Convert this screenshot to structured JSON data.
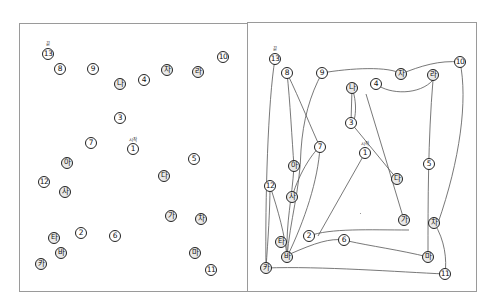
{
  "panels": {
    "left": {
      "title": "",
      "start_label": "시작",
      "end_label": "끝",
      "nodes": [
        {
          "label": "13",
          "x": 48,
          "y": 54
        },
        {
          "label": "8",
          "x": 60,
          "y": 69
        },
        {
          "label": "9",
          "x": 93,
          "y": 69
        },
        {
          "label": "나",
          "x": 120,
          "y": 84
        },
        {
          "label": "4",
          "x": 144,
          "y": 80
        },
        {
          "label": "자",
          "x": 167,
          "y": 70
        },
        {
          "label": "라",
          "x": 198,
          "y": 72
        },
        {
          "label": "10",
          "x": 223,
          "y": 57
        },
        {
          "label": "3",
          "x": 120,
          "y": 118
        },
        {
          "label": "7",
          "x": 91,
          "y": 143
        },
        {
          "label": "1",
          "x": 133,
          "y": 149
        },
        {
          "label": "아",
          "x": 67,
          "y": 163
        },
        {
          "label": "5",
          "x": 194,
          "y": 159
        },
        {
          "label": "다",
          "x": 164,
          "y": 176
        },
        {
          "label": "12",
          "x": 44,
          "y": 182
        },
        {
          "label": "사",
          "x": 65,
          "y": 192
        },
        {
          "label": "가",
          "x": 171,
          "y": 216
        },
        {
          "label": "차",
          "x": 201,
          "y": 219
        },
        {
          "label": "2",
          "x": 81,
          "y": 233
        },
        {
          "label": "6",
          "x": 115,
          "y": 236
        },
        {
          "label": "타",
          "x": 54,
          "y": 238
        },
        {
          "label": "바",
          "x": 61,
          "y": 253
        },
        {
          "label": "마",
          "x": 195,
          "y": 253
        },
        {
          "label": "카",
          "x": 41,
          "y": 264
        },
        {
          "label": "11",
          "x": 211,
          "y": 270
        }
      ]
    },
    "right": {
      "start_label": "시작",
      "end_label": "끝",
      "nodes": [
        {
          "label": "13",
          "x": 275,
          "y": 59
        },
        {
          "label": "8",
          "x": 287,
          "y": 73
        },
        {
          "label": "9",
          "x": 322,
          "y": 73
        },
        {
          "label": "나",
          "x": 352,
          "y": 88
        },
        {
          "label": "4",
          "x": 376,
          "y": 84
        },
        {
          "label": "자",
          "x": 401,
          "y": 74
        },
        {
          "label": "라",
          "x": 433,
          "y": 75
        },
        {
          "label": "10",
          "x": 460,
          "y": 62
        },
        {
          "label": "7",
          "x": 320,
          "y": 147
        },
        {
          "label": "3",
          "x": 351,
          "y": 123
        },
        {
          "label": "1",
          "x": 365,
          "y": 153
        },
        {
          "label": "아",
          "x": 294,
          "y": 166
        },
        {
          "label": "5",
          "x": 429,
          "y": 164
        },
        {
          "label": "다",
          "x": 397,
          "y": 179
        },
        {
          "label": "12",
          "x": 270,
          "y": 186
        },
        {
          "label": "사",
          "x": 292,
          "y": 197
        },
        {
          "label": "가",
          "x": 404,
          "y": 220
        },
        {
          "label": "차",
          "x": 434,
          "y": 223
        },
        {
          "label": "2",
          "x": 309,
          "y": 236
        },
        {
          "label": "6",
          "x": 344,
          "y": 240
        },
        {
          "label": "타",
          "x": 281,
          "y": 242
        },
        {
          "label": "바",
          "x": 287,
          "y": 257
        },
        {
          "label": "마",
          "x": 428,
          "y": 257
        },
        {
          "label": "카",
          "x": 266,
          "y": 268
        },
        {
          "label": "11",
          "x": 445,
          "y": 274
        }
      ],
      "trail_segments": [
        "M365,153 L318,236",
        "M309,236 C330,228 370,230 409,230",
        "M404,220 L386,160 L366,94",
        "M376,84 C390,95 420,95 433,80",
        "M433,80 C428,140 428,200 428,257",
        "M428,257 C400,250 370,246 348,241",
        "M344,240 C330,238 315,243 290,254",
        "M287,257 C290,220 300,190 301,150",
        "M301,150 C303,120 310,95 322,73",
        "M322,73 C350,68 390,66 401,74",
        "M401,74 C420,66 440,60 460,62",
        "M460,62 C468,100 460,160 438,223",
        "M434,223 C445,240 447,260 445,274",
        "M445,274 C400,272 320,266 266,268",
        "M266,268 C268,240 270,210 270,186",
        "M270,186 C278,210 285,235 287,257",
        "M287,257 C286,220 292,200 294,166",
        "M294,166 C292,140 290,100 287,73",
        "M287,73 C300,100 312,130 320,147",
        "M320,147 C318,180 305,220 287,257",
        "M352,88 L351,123",
        "M352,88 C360,110 352,130 351,123",
        "M351,123 L397,179",
        "M275,59 C268,100 265,200 266,268",
        "M292,197 C300,170 315,150 320,147"
      ]
    }
  }
}
